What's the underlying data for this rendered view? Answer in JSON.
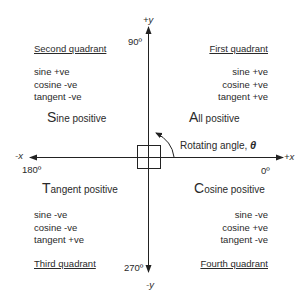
{
  "axes": {
    "plus_y": "+y",
    "minus_y": "-y",
    "plus_x": "+x",
    "minus_x": "-x",
    "angle_90": "90º",
    "angle_180": "180º",
    "angle_270": "270º",
    "angle_0": "0º",
    "rotating_label": "Rotating angle, ",
    "theta": "θ"
  },
  "quadrants": {
    "second": {
      "title": "Second quadrant",
      "lines": [
        "sine +ve",
        "cosine -ve",
        "tangent -ve"
      ],
      "initial": "S",
      "rest": "ine positive"
    },
    "first": {
      "title": "First quadrant",
      "lines": [
        "sine +ve",
        "cosine +ve",
        "tangent +ve"
      ],
      "initial": "A",
      "rest": "ll positive"
    },
    "third": {
      "title": "Third quadrant",
      "lines": [
        "sine -ve",
        "cosine -ve",
        "tangent +ve"
      ],
      "initial": "T",
      "rest": "angent positive"
    },
    "fourth": {
      "title": "Fourth quadrant",
      "lines": [
        "sine -ve",
        "cosine +ve",
        "tangent -ve"
      ],
      "initial": "C",
      "rest": "osine positive"
    }
  }
}
